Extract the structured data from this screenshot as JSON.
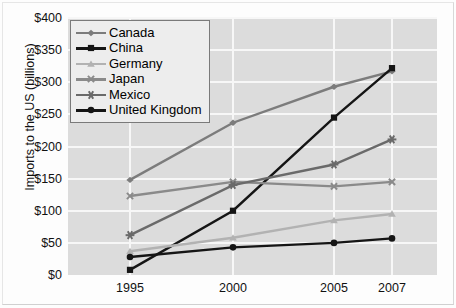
{
  "chart_data": {
    "type": "line",
    "title": "",
    "xlabel": "",
    "ylabel": "Imports to the US (billions)",
    "categories": [
      "1995",
      "2000",
      "2005",
      "2007"
    ],
    "x_positions": [
      130,
      233,
      334,
      392
    ],
    "ylim": [
      0,
      400
    ],
    "ytick_step": 50,
    "ytick_labels": [
      "$0",
      "$50",
      "$100",
      "$150",
      "$200",
      "$250",
      "$300",
      "$350",
      "$400"
    ],
    "grid": true,
    "legend_position": "top-left",
    "series": [
      {
        "name": "Canada",
        "marker": "diamond",
        "color": "#7c7c7c",
        "values": [
          148,
          237,
          293,
          317
        ]
      },
      {
        "name": "China",
        "marker": "square",
        "color": "#151515",
        "values": [
          8,
          100,
          245,
          322
        ]
      },
      {
        "name": "Germany",
        "marker": "triangle",
        "color": "#b2b2b2",
        "values": [
          37,
          58,
          85,
          95
        ]
      },
      {
        "name": "Japan",
        "marker": "x",
        "color": "#8a8a8a",
        "values": [
          123,
          145,
          138,
          145
        ]
      },
      {
        "name": "Mexico",
        "marker": "asterisk",
        "color": "#6a6a6a",
        "values": [
          62,
          140,
          172,
          211
        ]
      },
      {
        "name": "United Kingdom",
        "marker": "circle",
        "color": "#151515",
        "values": [
          28,
          43,
          50,
          57
        ]
      }
    ]
  },
  "legend": {
    "items": [
      {
        "label": "Canada"
      },
      {
        "label": "China"
      },
      {
        "label": "Germany"
      },
      {
        "label": "Japan"
      },
      {
        "label": "Mexico"
      },
      {
        "label": "United Kingdom"
      }
    ]
  },
  "axes": {
    "y_title": "Imports to the US (billions)"
  },
  "colors": {
    "plot_background": "#dcdcdc",
    "gridline": "#f7f7f7",
    "legend_background": "#ededed",
    "legend_border": "#7a7a7a",
    "text": "#111111"
  }
}
